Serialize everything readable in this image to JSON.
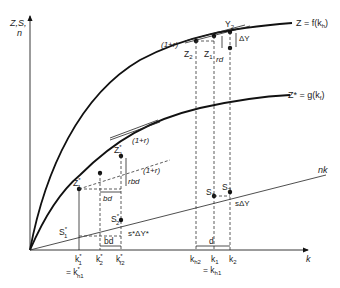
{
  "diagram": {
    "axis_labels": {
      "y_line1": "Z,S,",
      "y_line2": "n",
      "x": "k"
    },
    "curves": {
      "upper": "Z = f(k",
      "upper_sub": "h",
      "upper_close": ")",
      "lower": "Z* = g(k",
      "lower_sub": "f",
      "lower_close": ")",
      "line": "nk"
    },
    "upper_points": {
      "z1": "Z",
      "z1_sub": "1",
      "z2": "Z",
      "z2_sub": "2",
      "y2": "Y",
      "y2_sub": "2",
      "one_plus_r": "(1+r)",
      "rd": "rd",
      "delta_y": "ΔY"
    },
    "lower_points": {
      "z1": "Z",
      "z1_sup": "*",
      "z1_sub": "1",
      "z2": "Z",
      "z2_sup": "*",
      "z2_sub": "2",
      "one_plus_r_upper": "(1+r)",
      "one_plus_r_lower": "(1+r)",
      "rbd": "rbd",
      "bd": "bd"
    },
    "savings_points": {
      "s1": "S",
      "s1_sub": "1",
      "s2": "S",
      "s2_sub": "2",
      "s_delta": "sΔY",
      "s1_star": "S",
      "s1_star_sup": "*",
      "s1_star_sub": "1",
      "s2_star": "S",
      "s2_star_sup": "*",
      "s2_star_sub": "2",
      "s_star_delta": "s*ΔY*",
      "bd_bottom": "bd",
      "d_bottom": "d"
    },
    "ticks": {
      "k1_star": "k",
      "k1_star_sup": "*",
      "k1_star_sub": "1",
      "k2_star": "k",
      "k2_star_sup": "*",
      "k2_star_sub": "2",
      "kf2_star": "k",
      "kf2_star_sup": "*",
      "kf2_star_sub": "f2",
      "eq_kh1_star": "= k",
      "eq_kh1_star_sup": "*",
      "eq_kh1_star_sub": "h1",
      "kh2": "k",
      "kh2_sub": "h2",
      "k1": "k",
      "k1_sub": "1",
      "k2": "k",
      "k2_sub": "2",
      "eq_kh1": "= k",
      "eq_kh1_sub": "h1"
    }
  }
}
